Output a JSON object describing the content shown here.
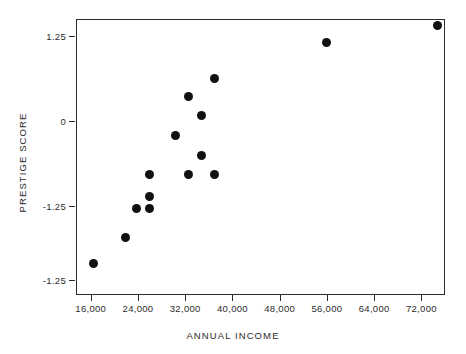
{
  "figure": {
    "caption_remnant": "",
    "background_color": "#ffffff",
    "point_color": "#111111",
    "axis_color": "#2b2b2b"
  },
  "axes": {
    "x_title": "ANNUAL INCOME",
    "y_title": "PRESTIGE SCORE",
    "x_ticks": [
      "16,000",
      "24,000",
      "32,000",
      "40,000",
      "48,000",
      "56,000",
      "64,000",
      "72,000"
    ],
    "y_ticks": [
      "1.25",
      "0",
      "-1.25",
      "-1.25"
    ]
  },
  "chart_data": {
    "type": "scatter",
    "title": "",
    "xlabel": "ANNUAL INCOME",
    "ylabel": "PRESTIGE SCORE",
    "xlim": [
      13500,
      76000
    ],
    "ylim": [
      -2.55,
      1.5
    ],
    "grid": false,
    "legend": null,
    "x_tick_values": [
      16000,
      24000,
      32000,
      40000,
      48000,
      56000,
      64000,
      72000
    ],
    "x_tick_labels": [
      "16,000",
      "24,000",
      "32,000",
      "40,000",
      "48,000",
      "56,000",
      "64,000",
      "72,000"
    ],
    "y_tick_values": [
      1.25,
      0,
      -1.25,
      -2.33
    ],
    "y_tick_labels": [
      "1.25",
      "0",
      "-1.25",
      "-1.25"
    ],
    "marker": "filled-circle",
    "marker_size": 9,
    "points": [
      {
        "x": 16400,
        "y": -2.09
      },
      {
        "x": 21900,
        "y": -1.7
      },
      {
        "x": 23700,
        "y": -1.28
      },
      {
        "x": 25900,
        "y": -1.28
      },
      {
        "x": 25900,
        "y": -1.11
      },
      {
        "x": 25900,
        "y": -0.78
      },
      {
        "x": 30300,
        "y": -0.21
      },
      {
        "x": 32600,
        "y": 0.37
      },
      {
        "x": 32600,
        "y": -0.78
      },
      {
        "x": 34800,
        "y": 0.09
      },
      {
        "x": 34800,
        "y": -0.51
      },
      {
        "x": 37000,
        "y": -0.78
      },
      {
        "x": 37000,
        "y": 0.62
      },
      {
        "x": 55900,
        "y": 1.16
      },
      {
        "x": 74700,
        "y": 1.4
      }
    ]
  }
}
